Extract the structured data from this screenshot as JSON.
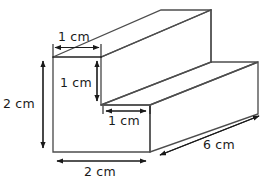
{
  "diagram": {
    "shape_name": "l-shaped-step-prism",
    "units": "cm",
    "stroke_color": "#4d4d4d",
    "label_color": "#1a1a1a",
    "background_color": "#ffffff",
    "labels": {
      "top_notch_width": "1 cm",
      "notch_height": "1 cm",
      "step_tread_depth": "1 cm",
      "total_height": "2 cm",
      "total_width": "2 cm",
      "length": "6 cm"
    },
    "dimensions": [
      {
        "name": "top-notch-width",
        "value": 1,
        "unit": "cm",
        "edge": "top-front-left-horizontal"
      },
      {
        "name": "notch-height",
        "value": 1,
        "unit": "cm",
        "edge": "inner-vertical-riser"
      },
      {
        "name": "step-tread-depth",
        "value": 1,
        "unit": "cm",
        "edge": "front-step-horizontal"
      },
      {
        "name": "total-height",
        "value": 2,
        "unit": "cm",
        "edge": "front-left-vertical"
      },
      {
        "name": "total-width",
        "value": 2,
        "unit": "cm",
        "edge": "front-bottom-horizontal"
      },
      {
        "name": "length",
        "value": 6,
        "unit": "cm",
        "edge": "bottom-right-depth"
      }
    ],
    "geometry": {
      "front_face_outline": "53,57 101,57 101,105 150,105 150,152 53,152",
      "depth_offset_x": 108,
      "depth_offset_y": -47
    }
  }
}
